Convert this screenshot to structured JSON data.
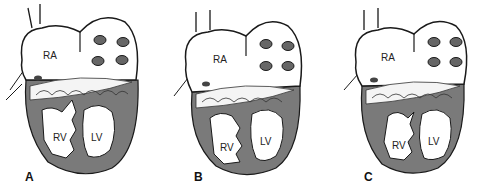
{
  "colors": {
    "myocardium": "#7a7a7a",
    "outline": "#1a1a1a",
    "background": "#ffffff",
    "chamber": "#ffffff"
  },
  "panels": [
    {
      "letter": "A",
      "labels": {
        "ra": "RA",
        "rv": "RV",
        "lv": "LV"
      }
    },
    {
      "letter": "B",
      "labels": {
        "ra": "RA",
        "rv": "RV",
        "lv": "LV"
      }
    },
    {
      "letter": "C",
      "labels": {
        "ra": "RA",
        "rv": "RV",
        "lv": "LV"
      }
    }
  ]
}
